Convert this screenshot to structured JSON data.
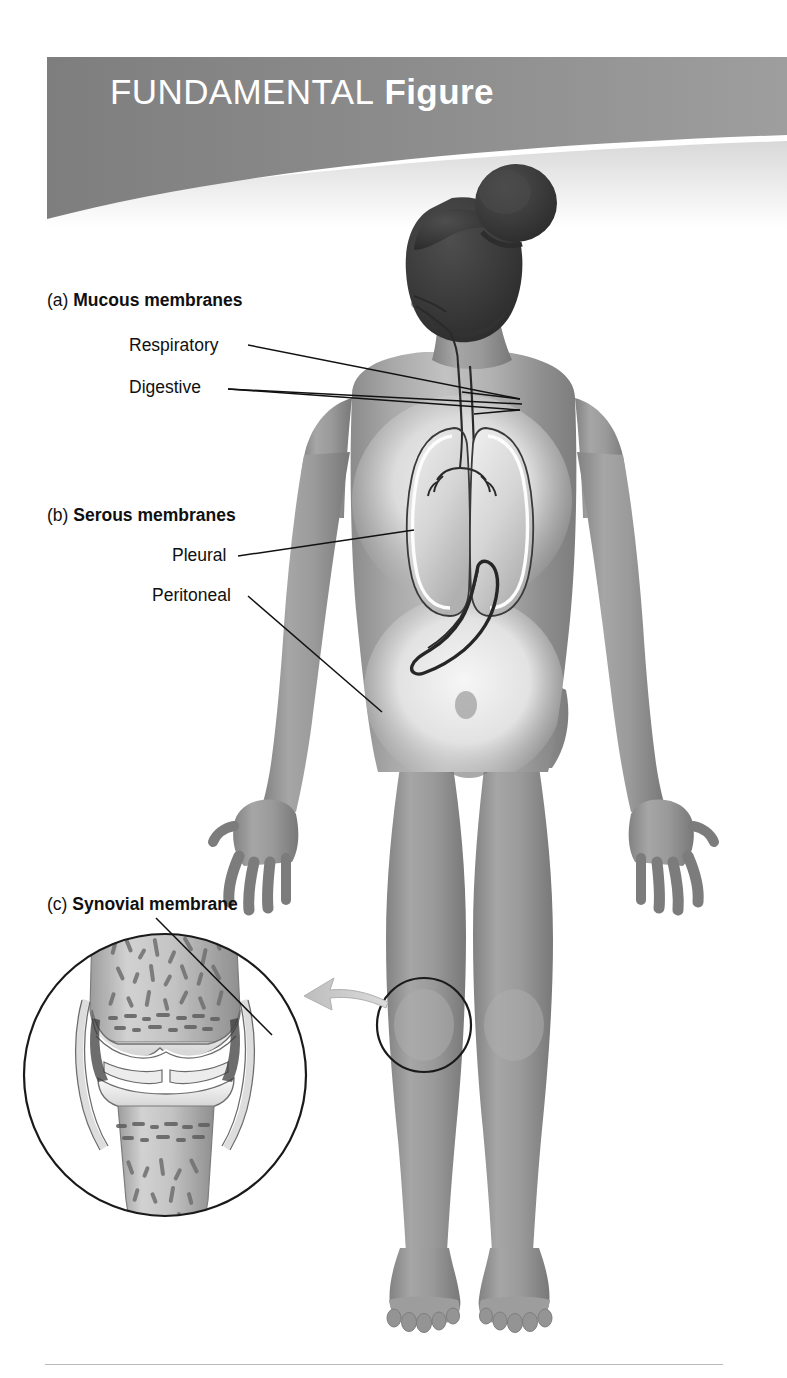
{
  "page": {
    "background_color": "#ffffff",
    "width": 787,
    "height": 1378
  },
  "banner": {
    "title_light": "FUNDAMENTAL",
    "title_bold": "Figure",
    "background_color": "#8b8b8b",
    "text_color": "#ffffff"
  },
  "labels": {
    "mucous": {
      "index": "(a)",
      "title": "Mucous membranes",
      "items": [
        {
          "label": "Respiratory"
        },
        {
          "label": "Digestive"
        }
      ]
    },
    "serous": {
      "index": "(b)",
      "title": "Serous membranes",
      "items": [
        {
          "label": "Pleural"
        },
        {
          "label": "Peritoneal"
        }
      ]
    },
    "synovial": {
      "index": "(c)",
      "title": "Synovial membrane",
      "items": []
    }
  },
  "figure": {
    "skin_tone": "#9a9a9a",
    "hair_color": "#3a3a3a",
    "organs": [
      "nasal-cavity",
      "oral-cavity",
      "trachea",
      "bronchi",
      "left-lung",
      "right-lung",
      "pleural-membrane",
      "esophagus",
      "stomach",
      "peritoneal-cavity"
    ],
    "inset": {
      "subject": "knee-joint-cross-section",
      "shape": "circle",
      "callout_circle_on_body": "left-knee",
      "arrow_color": "#c9c9c9",
      "structures": [
        "femur",
        "tibia",
        "articular-cartilage",
        "meniscus",
        "synovial-membrane",
        "joint-capsule",
        "spongy-bone"
      ]
    }
  },
  "line_color": "#111111",
  "rule_color": "#b9b9b9"
}
